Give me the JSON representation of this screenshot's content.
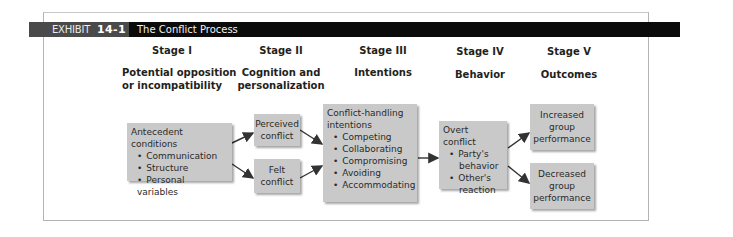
{
  "exhibit": {
    "label": "EXHIBIT",
    "number": "14-1",
    "title": "The Conflict Process"
  },
  "stages": [
    {
      "heading": "Stage I",
      "subtitle_lines": [
        "Potential opposition",
        "or incompatibility"
      ]
    },
    {
      "heading": "Stage II",
      "subtitle_lines": [
        "Cognition and",
        "personalization"
      ]
    },
    {
      "heading": "Stage III",
      "subtitle_lines": [
        "Intentions"
      ]
    },
    {
      "heading": "Stage IV",
      "subtitle_lines": [
        "Behavior"
      ]
    },
    {
      "heading": "Stage V",
      "subtitle_lines": [
        "Outcomes"
      ]
    }
  ],
  "boxes": {
    "antecedent": {
      "title": "Antecedent conditions",
      "items": [
        "Communication",
        "Structure",
        "Personal variables"
      ]
    },
    "perceived": {
      "lines": [
        "Perceived",
        "conflict"
      ]
    },
    "felt": {
      "lines": [
        "Felt",
        "conflict"
      ]
    },
    "intentions": {
      "title_lines": [
        "Conflict-handling",
        "intentions"
      ],
      "items": [
        "Competing",
        "Collaborating",
        "Compromising",
        "Avoiding",
        "Accommodating"
      ]
    },
    "overt": {
      "title": "Overt conflict",
      "items": [
        [
          "Party's",
          "behavior"
        ],
        [
          "Other's",
          "reaction"
        ]
      ]
    },
    "increased": {
      "lines": [
        "Increased",
        "group",
        "performance"
      ]
    },
    "decreased": {
      "lines": [
        "Decreased",
        "group",
        "performance"
      ]
    }
  },
  "colors": {
    "title_bar": "#0b0b0b",
    "label_box": "#4a4a4a",
    "box_fill": "#c9c9c9",
    "arrow": "#333333"
  }
}
